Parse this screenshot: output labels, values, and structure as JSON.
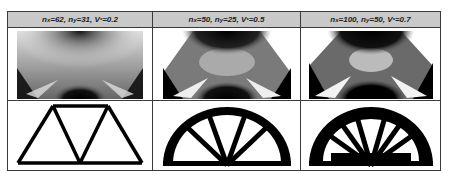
{
  "figure": {
    "columns": [
      {
        "nx_label": "n",
        "nx_sub": "x",
        "nx_val": "=62, ",
        "ny_label": "n",
        "ny_sub": "y",
        "ny_val": "=31, ",
        "v_label": "V",
        "v_sup": "*",
        "v_val": "=0.2"
      },
      {
        "nx_label": "n",
        "nx_sub": "x",
        "nx_val": "=50, ",
        "ny_label": "n",
        "ny_sub": "y",
        "ny_val": "=25, ",
        "v_label": "V",
        "v_sup": "*",
        "v_val": "=0.5"
      },
      {
        "nx_label": "n",
        "nx_sub": "x",
        "nx_val": "=100, ",
        "ny_label": "n",
        "ny_sub": "y",
        "ny_val": "=50, ",
        "v_label": "V",
        "v_sup": "*",
        "v_val": "=0.7"
      }
    ],
    "rows": [
      {
        "name": "density-field",
        "description": "grayscale stress/density distribution"
      },
      {
        "name": "optimized-structure",
        "description": "binary topology-optimized structure"
      }
    ],
    "colors": {
      "header_bg": "#c9c9c9",
      "border": "#3a3a3a",
      "solid": "#000000",
      "void": "#ffffff"
    }
  }
}
